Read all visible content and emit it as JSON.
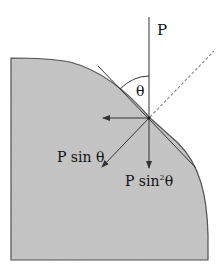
{
  "diagram": {
    "labels": {
      "force": "P",
      "angle": "θ",
      "component_sin": "P sin θ",
      "component_sin2_base": "P sin",
      "component_sin2_exp": "2",
      "component_sin2_theta": "θ"
    },
    "colors": {
      "fill": "#c4c4c4",
      "stroke": "#444444",
      "line": "#333333",
      "dashed": "#888888",
      "background": "#ffffff"
    },
    "elements": [
      "shaded-body-with-curved-corner",
      "vertical-force-line-P",
      "tangent-line",
      "dashed-normal-line",
      "angle-arc-theta",
      "horizontal-arrow-left",
      "diagonal-arrow-P-sin-theta",
      "vertical-arrow-P-sin2-theta"
    ]
  }
}
